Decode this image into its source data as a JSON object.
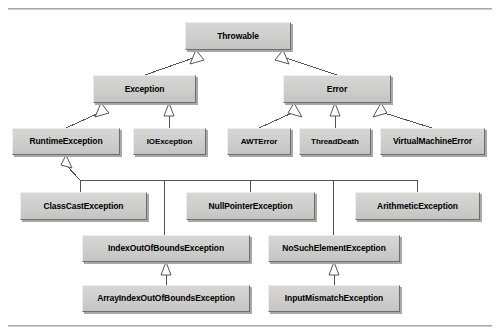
{
  "figure": {
    "background_color": "#ffffff",
    "box_fill_color": "#cfcfcd",
    "box_shadow_color": "#a8a8a6",
    "line_color": "#555555",
    "rules": {
      "top_label": "top-rule",
      "bottom_label": "bottom-rule"
    }
  },
  "nodes": [
    {
      "id": "throwable",
      "label": "Throwable",
      "x": 185,
      "y": 22,
      "w": 106,
      "h": 28,
      "row": 1
    },
    {
      "id": "exception",
      "label": "Exception",
      "x": 93,
      "y": 75,
      "w": 103,
      "h": 28,
      "row": 2
    },
    {
      "id": "error",
      "label": "Error",
      "x": 283,
      "y": 75,
      "w": 108,
      "h": 28,
      "row": 2
    },
    {
      "id": "runtime-exception",
      "label": "RuntimeException",
      "x": 12,
      "y": 128,
      "w": 108,
      "h": 27,
      "row": 3
    },
    {
      "id": "io-exception",
      "label": "IOException",
      "x": 133,
      "y": 128,
      "w": 73,
      "h": 27,
      "row": 3
    },
    {
      "id": "awt-error",
      "label": "AWTError",
      "x": 227,
      "y": 128,
      "w": 64,
      "h": 27,
      "row": 3
    },
    {
      "id": "thread-death",
      "label": "ThreadDeath",
      "x": 299,
      "y": 128,
      "w": 72,
      "h": 27,
      "row": 3
    },
    {
      "id": "virtual-machine-error",
      "label": "VirtualMachineError",
      "x": 380,
      "y": 128,
      "w": 105,
      "h": 27,
      "row": 3
    },
    {
      "id": "class-cast-exception",
      "label": "ClassCastException",
      "x": 20,
      "y": 192,
      "w": 127,
      "h": 28,
      "row": 4
    },
    {
      "id": "null-pointer-exception",
      "label": "NullPointerException",
      "x": 186,
      "y": 192,
      "w": 129,
      "h": 28,
      "row": 4
    },
    {
      "id": "arithmetic-exception",
      "label": "ArithmeticException",
      "x": 355,
      "y": 192,
      "w": 125,
      "h": 28,
      "row": 4
    },
    {
      "id": "index-out-of-bounds-exception",
      "label": "IndexOutOfBoundsException",
      "x": 82,
      "y": 235,
      "w": 168,
      "h": 27,
      "row": 5
    },
    {
      "id": "no-such-element-exception",
      "label": "NoSuchElementException",
      "x": 268,
      "y": 235,
      "w": 132,
      "h": 27,
      "row": 5
    },
    {
      "id": "array-index-oob-exception",
      "label": "ArrayIndexOutOfBoundsException",
      "x": 82,
      "y": 285,
      "w": 168,
      "h": 27,
      "row": 6
    },
    {
      "id": "input-mismatch-exception",
      "label": "InputMismatchException",
      "x": 268,
      "y": 285,
      "w": 132,
      "h": 27,
      "row": 6
    }
  ],
  "edges": [
    {
      "from": "exception",
      "to": "throwable",
      "kind": "generalization"
    },
    {
      "from": "error",
      "to": "throwable",
      "kind": "generalization"
    },
    {
      "from": "runtime-exception",
      "to": "exception",
      "kind": "generalization"
    },
    {
      "from": "io-exception",
      "to": "exception",
      "kind": "generalization"
    },
    {
      "from": "awt-error",
      "to": "error",
      "kind": "generalization"
    },
    {
      "from": "thread-death",
      "to": "error",
      "kind": "generalization"
    },
    {
      "from": "virtual-machine-error",
      "to": "error",
      "kind": "generalization"
    },
    {
      "from": "class-cast-exception",
      "to": "runtime-exception",
      "kind": "generalization"
    },
    {
      "from": "null-pointer-exception",
      "to": "runtime-exception",
      "kind": "generalization"
    },
    {
      "from": "arithmetic-exception",
      "to": "runtime-exception",
      "kind": "generalization"
    },
    {
      "from": "index-out-of-bounds-exception",
      "to": "runtime-exception",
      "kind": "generalization"
    },
    {
      "from": "no-such-element-exception",
      "to": "runtime-exception",
      "kind": "generalization"
    },
    {
      "from": "array-index-oob-exception",
      "to": "index-out-of-bounds-exception",
      "kind": "generalization"
    },
    {
      "from": "input-mismatch-exception",
      "to": "no-such-element-exception",
      "kind": "generalization"
    }
  ]
}
